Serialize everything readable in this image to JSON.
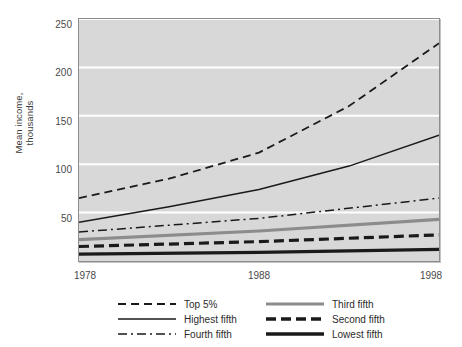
{
  "chart_data": {
    "type": "line",
    "title": "",
    "xlabel": "",
    "ylabel": "Mean income,\nthousands",
    "x": [
      1978,
      1998
    ],
    "xticks": [
      "1978",
      "1988",
      "1998"
    ],
    "xtick_values": [
      1978,
      1988,
      1998
    ],
    "yticks": [
      "50",
      "100",
      "150",
      "200",
      "250"
    ],
    "ytick_values": [
      50,
      100,
      150,
      200,
      250
    ],
    "xlim": [
      1978,
      1998
    ],
    "ylim": [
      0,
      250
    ],
    "grid": "horizontal white gridlines",
    "legend_position": "below plot, two columns",
    "plot_background": "#d8d8d8",
    "series": [
      {
        "name": "Top 5%",
        "style": "dashed",
        "color": "#1a1a1a",
        "width": 1.6,
        "values": [
          65,
          225
        ],
        "points": [
          [
            1978,
            65
          ],
          [
            1983,
            85
          ],
          [
            1988,
            112
          ],
          [
            1993,
            160
          ],
          [
            1998,
            225
          ]
        ]
      },
      {
        "name": "Highest fifth",
        "style": "solid",
        "color": "#1a1a1a",
        "width": 1.4,
        "values": [
          40,
          130
        ],
        "points": [
          [
            1978,
            40
          ],
          [
            1983,
            56
          ],
          [
            1988,
            74
          ],
          [
            1993,
            98
          ],
          [
            1998,
            130
          ]
        ]
      },
      {
        "name": "Fourth fifth",
        "style": "dash-dot",
        "color": "#1a1a1a",
        "width": 1.4,
        "values": [
          30,
          65
        ],
        "points": [
          [
            1978,
            30
          ],
          [
            1988,
            44
          ],
          [
            1998,
            65
          ]
        ]
      },
      {
        "name": "Third fifth",
        "style": "solid-gray",
        "color": "#8c8c8c",
        "width": 3,
        "values": [
          22,
          43
        ],
        "points": [
          [
            1978,
            22
          ],
          [
            1988,
            31
          ],
          [
            1998,
            43
          ]
        ]
      },
      {
        "name": "Second fifth",
        "style": "thick-dashed",
        "color": "#1a1a1a",
        "width": 3,
        "values": [
          15,
          27
        ],
        "points": [
          [
            1978,
            15
          ],
          [
            1988,
            20
          ],
          [
            1998,
            27
          ]
        ]
      },
      {
        "name": "Lowest fifth",
        "style": "thick-solid",
        "color": "#1a1a1a",
        "width": 3,
        "values": [
          7,
          12
        ],
        "points": [
          [
            1978,
            7
          ],
          [
            1988,
            9
          ],
          [
            1998,
            12
          ]
        ]
      }
    ]
  },
  "legend": {
    "column1": [
      "Top 5%",
      "Highest fifth",
      "Fourth fifth"
    ],
    "column2": [
      "Third fifth",
      "Second fifth",
      "Lowest fifth"
    ]
  }
}
